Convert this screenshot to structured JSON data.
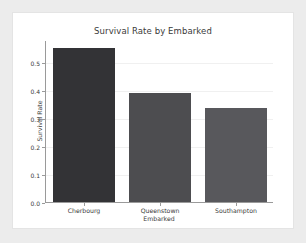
{
  "page": {
    "background_color": "#ececec",
    "card_background_color": "#ffffff"
  },
  "chart_data": {
    "type": "bar",
    "title": "Survival Rate by Embarked",
    "xlabel": "Embarked",
    "ylabel": "Survival Rate",
    "categories": [
      "Cherbourg",
      "Queenstown",
      "Southampton"
    ],
    "values": [
      0.553,
      0.39,
      0.336
    ],
    "bar_colors": [
      "#333336",
      "#4d4d50",
      "#58585c"
    ],
    "ylim": [
      0.0,
      0.58
    ],
    "yticks": [
      0.0,
      0.1,
      0.2,
      0.3,
      0.4,
      0.5
    ],
    "ytick_labels": [
      "0.0",
      "0.1",
      "0.2",
      "0.3",
      "0.4",
      "0.5"
    ],
    "grid": true,
    "grid_color": "#f0f0f0",
    "legend": null,
    "axis_color": "#9a9a9a",
    "text_color": "#3a3a3a"
  }
}
